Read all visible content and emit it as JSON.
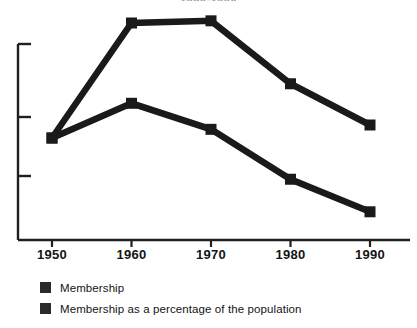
{
  "chart_data": {
    "type": "line",
    "title": "1950-1990",
    "title_note": "cropped at top edge of image",
    "xlabel": "",
    "ylabel": "",
    "categories": [
      "1950",
      "1960",
      "1970",
      "1980",
      "1990"
    ],
    "x": [
      1950,
      1960,
      1970,
      1980,
      1990
    ],
    "grid": false,
    "legend_position": "bottom-left",
    "y_axis": {
      "labels_shown": false,
      "tick_count": 4,
      "tick_positions_relative": [
        1.0,
        0.67,
        0.33,
        0.0
      ],
      "note": "y-axis has unlabeled tick marks only"
    },
    "series": [
      {
        "name": "Membership",
        "color": "#1a1a1a",
        "marker": "square",
        "values": [
          0.47,
          1.0,
          1.01,
          0.72,
          0.53
        ],
        "values_note": "relative heights read from pixel positions; axis unlabeled"
      },
      {
        "name": "Membership as a percentage of the population",
        "color": "#1a1a1a",
        "marker": "square",
        "values": [
          0.47,
          0.63,
          0.51,
          0.28,
          0.13
        ],
        "values_note": "relative heights read from pixel positions; axis unlabeled"
      }
    ]
  },
  "legend": {
    "items": [
      {
        "label": "Membership",
        "swatch_color": "#2a2a2a"
      },
      {
        "label": "Membership as a percentage of the population",
        "swatch_color": "#2a2a2a"
      }
    ]
  },
  "axes": {
    "axis_color": "#1f1f1f"
  }
}
